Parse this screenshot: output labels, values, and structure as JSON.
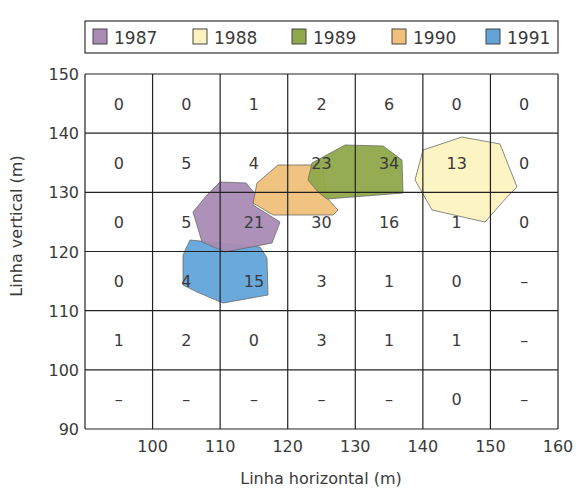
{
  "chart_data": {
    "type": "heatmap",
    "title": "",
    "xlabel": "Linha horizontal (m)",
    "ylabel": "Linha vertical (m)",
    "xlim": [
      90,
      160
    ],
    "ylim": [
      90,
      150
    ],
    "x_ticks": [
      "100",
      "110",
      "120",
      "130",
      "140",
      "150",
      "160"
    ],
    "y_ticks": [
      "150",
      "140",
      "130",
      "120",
      "110",
      "100",
      "90"
    ],
    "grid": true,
    "legend_position": "top",
    "legend": [
      {
        "label": "1987",
        "color": "#a98bb5"
      },
      {
        "label": "1988",
        "color": "#fcf3bf"
      },
      {
        "label": "1989",
        "color": "#8fa84a"
      },
      {
        "label": "1990",
        "color": "#f0c07a"
      },
      {
        "label": "1991",
        "color": "#62a4da"
      }
    ],
    "cell_rows_y_ranges": [
      "140-150",
      "130-140",
      "120-130",
      "110-120",
      "100-110",
      "90-100"
    ],
    "cell_cols_x_ranges": [
      "90-100",
      "100-110",
      "110-120",
      "120-130",
      "130-140",
      "140-150",
      "150-160"
    ],
    "cells": [
      [
        "0",
        "0",
        "1",
        "2",
        "6",
        "0",
        "0"
      ],
      [
        "0",
        "5",
        "4",
        "23",
        "34",
        "13",
        "0"
      ],
      [
        "0",
        "5",
        "21",
        "30",
        "16",
        "1",
        "0"
      ],
      [
        "0",
        "4",
        "15",
        "3",
        "1",
        "0",
        "–"
      ],
      [
        "1",
        "2",
        "0",
        "3",
        "1",
        "1",
        "–"
      ],
      [
        "–",
        "–",
        "–",
        "–",
        "–",
        "0",
        "–"
      ]
    ],
    "regions": [
      {
        "year": "1991",
        "color": "#62a4da",
        "points": "190,240 183,255 183,285 197,292 223,303 268,295 267,258 260,247"
      },
      {
        "year": "1987",
        "color": "#a98bb5",
        "points": "220,182 246,183 256,195 253,205 280,222 272,243 225,252 202,242 193,212 207,195"
      },
      {
        "year": "1990",
        "color": "#f0c07a",
        "points": "278,165 322,165 327,198 338,210 333,215 273,215 253,203 257,183"
      },
      {
        "year": "1989",
        "color": "#8fa84a",
        "points": "345,145 383,146 402,160 403,193 327,199 318,192 308,180 312,163"
      },
      {
        "year": "1988",
        "color": "#fcf3bf",
        "points": "423,150 462,137 500,144 517,187 507,197 485,222 432,210 415,180"
      }
    ]
  }
}
